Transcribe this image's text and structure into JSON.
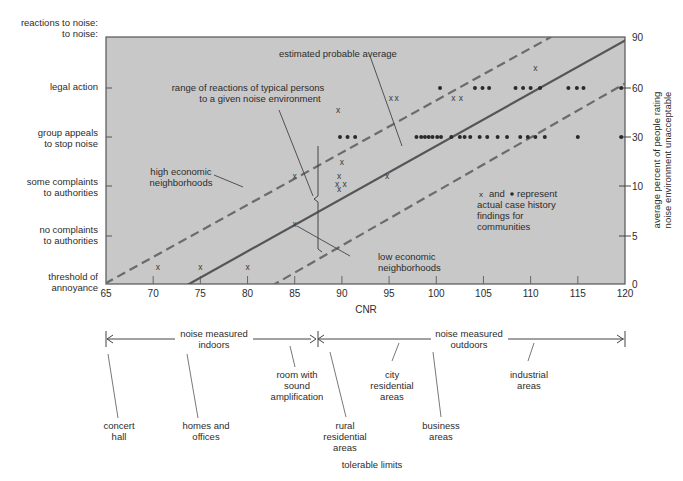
{
  "chart_data": {
    "type": "scatter",
    "title": "",
    "xlabel": "CNR",
    "ylabel_left": "reactions to noise:",
    "ylabel_right": [
      "average percent of people rating",
      "noise environment unacceptable"
    ],
    "xlim": [
      65,
      120
    ],
    "x_ticks": [
      65,
      70,
      75,
      80,
      85,
      90,
      95,
      100,
      105,
      110,
      115,
      120
    ],
    "left_categories": [
      {
        "label": [
          "threshold of",
          "annoyance"
        ],
        "level": 0
      },
      {
        "label": [
          "no complaints",
          "to authorities"
        ],
        "level": 1
      },
      {
        "label": [
          "some complaints",
          "to authorities"
        ],
        "level": 2
      },
      {
        "label": [
          "group appeals",
          "to stop noise"
        ],
        "level": 3
      },
      {
        "label": [
          "legal action"
        ],
        "level": 4
      }
    ],
    "right_ticks": [
      {
        "value": 0,
        "level": 0
      },
      {
        "value": 5,
        "level": 1
      },
      {
        "value": 10,
        "level": 2
      },
      {
        "value": 30,
        "level": 3
      },
      {
        "value": 60,
        "level": 4
      },
      {
        "value": 90,
        "level": 5
      }
    ],
    "lines": [
      {
        "name": "estimated probable average",
        "style": "solid",
        "x": [
          73.8,
          120
        ],
        "y": [
          0,
          4.93
        ]
      },
      {
        "name": "high economic neighborhoods",
        "style": "dashed",
        "x": [
          65.3,
          120
        ],
        "y": [
          0.05,
          5.83
        ]
      },
      {
        "name": "low economic neighborhoods",
        "style": "dashed",
        "x": [
          82.9,
          120
        ],
        "y": [
          0,
          4.06
        ]
      }
    ],
    "series": [
      {
        "name": "x (case history findings)",
        "marker": "x",
        "points": [
          [
            70.5,
            0.35
          ],
          [
            75,
            0.35
          ],
          [
            80,
            0.35
          ],
          [
            85,
            1.25
          ],
          [
            85,
            2.2
          ],
          [
            89.5,
            2.05
          ],
          [
            89.7,
            2.2
          ],
          [
            90.3,
            2.05
          ],
          [
            89.7,
            1.95
          ],
          [
            90,
            2.5
          ],
          [
            89.6,
            3.55
          ],
          [
            94.8,
            2.2
          ],
          [
            95.2,
            3.8
          ],
          [
            95.8,
            3.8
          ],
          [
            101.8,
            3.8
          ],
          [
            102.6,
            3.8
          ],
          [
            110.5,
            4.4
          ]
        ]
      },
      {
        "name": "dot (case history findings)",
        "marker": "dot",
        "points": [
          [
            89.8,
            3.0
          ],
          [
            90.6,
            3.0
          ],
          [
            91.4,
            3.0
          ],
          [
            97.9,
            3.0
          ],
          [
            98.4,
            3.0
          ],
          [
            98.8,
            3.0
          ],
          [
            99.2,
            3.0
          ],
          [
            99.6,
            3.0
          ],
          [
            100.1,
            3.0
          ],
          [
            100.5,
            3.0
          ],
          [
            101.6,
            3.0
          ],
          [
            102.5,
            3.0
          ],
          [
            103.0,
            3.0
          ],
          [
            103.6,
            3.0
          ],
          [
            104.6,
            3.0
          ],
          [
            105.4,
            3.0
          ],
          [
            106.5,
            3.0
          ],
          [
            107.5,
            3.0
          ],
          [
            108.9,
            3.0
          ],
          [
            109.7,
            3.0
          ],
          [
            110.5,
            3.0
          ],
          [
            111.5,
            3.0
          ],
          [
            115.0,
            3.0
          ],
          [
            119.6,
            3.0
          ],
          [
            100.4,
            4.0
          ],
          [
            104.1,
            4.0
          ],
          [
            104.9,
            4.0
          ],
          [
            105.6,
            4.0
          ],
          [
            108.4,
            4.0
          ],
          [
            109.2,
            4.0
          ],
          [
            110.0,
            4.0
          ],
          [
            111.0,
            4.0
          ],
          [
            114.0,
            4.0
          ],
          [
            114.9,
            4.0
          ],
          [
            115.6,
            4.0
          ],
          [
            119.6,
            4.0
          ]
        ]
      }
    ],
    "annotations": {
      "estimated_average": "estimated probable average",
      "range_line1": "range of reactions of typical persons",
      "range_line2": "to a given noise environment",
      "high_econ_1": "high economic",
      "high_econ_2": "neighborhoods",
      "low_econ_1": "low economic",
      "low_econ_2": "neighborhoods",
      "legend_1a": "and",
      "legend_1b": "represent",
      "legend_2": "actual case history",
      "legend_3": "findings for",
      "legend_4": "communities"
    },
    "colors": {
      "plot_bg": "#c8c8c8",
      "line": "#555555",
      "dashed": "#6b6b6b",
      "marker": "#2a2a2a",
      "text": "#2c2c2c"
    },
    "grid": false,
    "legend_position": "inside-right"
  },
  "bottom_scale": {
    "indoors_label": [
      "noise measured",
      "indoors"
    ],
    "outdoors_label": [
      "noise measured",
      "outdoors"
    ],
    "footer": "tolerable limits",
    "environments": [
      {
        "label": [
          "concert",
          "hall"
        ]
      },
      {
        "label": [
          "homes and",
          "offices"
        ]
      },
      {
        "label": [
          "room with",
          "sound",
          "amplification"
        ]
      },
      {
        "label": [
          "rural",
          "residential",
          "areas"
        ]
      },
      {
        "label": [
          "city",
          "residential",
          "areas"
        ]
      },
      {
        "label": [
          "business",
          "areas"
        ]
      },
      {
        "label": [
          "industrial",
          "areas"
        ]
      }
    ]
  }
}
